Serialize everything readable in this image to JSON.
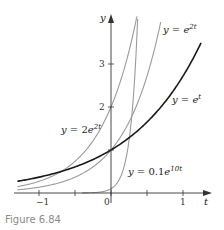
{
  "caption": "Figure 6.84",
  "colors": {
    "axis": "#333333",
    "primary_curve": "#1a1a1a",
    "secondary_curve": "#9a9a9a",
    "caption": "#8a8a8a"
  },
  "chart_data": {
    "type": "line",
    "title": "",
    "xlabel": "t",
    "ylabel": "y",
    "xlim": [
      -1.3,
      1.35
    ],
    "ylim": [
      0,
      4.1
    ],
    "grid": false,
    "x_ticks": [
      -1,
      -0.5,
      0,
      0.5,
      1
    ],
    "x_tick_labels": [
      "-1",
      "",
      "0",
      "",
      "1"
    ],
    "y_ticks": [
      1,
      2,
      3
    ],
    "y_tick_labels": [
      "",
      "2",
      "3"
    ],
    "series": [
      {
        "name": "y = e^t",
        "formula": "e^t",
        "k": 1,
        "a": 1,
        "t_range": [
          -1.3,
          1.25
        ],
        "style": "bold-black",
        "label": {
          "text": "y = e",
          "sup": "t",
          "x": 172,
          "y": 103
        }
      },
      {
        "name": "y = e^{2t}",
        "formula": "e^(2t)",
        "k": 2,
        "a": 1,
        "t_range": [
          -1.3,
          0.69
        ],
        "style": "gray",
        "label": {
          "text": "y = e",
          "sup": "2t",
          "x": 163,
          "y": 33
        }
      },
      {
        "name": "y = 2e^{2t}",
        "formula": "2e^(2t)",
        "k": 2,
        "a": 2,
        "t_range": [
          -1.3,
          0.36
        ],
        "style": "gray",
        "label": {
          "text": "y = 2e",
          "sup": "2t",
          "x": 61,
          "y": 133
        }
      },
      {
        "name": "y = 0.1e^{10t}",
        "formula": "0.1e^(10t)",
        "k": 10,
        "a": 0.1,
        "t_range": [
          -0.4,
          0.37
        ],
        "style": "gray",
        "label": {
          "text": "y = 0.1e",
          "sup": "10t",
          "x": 128,
          "y": 175
        }
      }
    ],
    "annotations": [
      "y = e^{2t}",
      "y = e^t",
      "y = 2e^{2t}",
      "y = 0.1e^{10t}"
    ]
  }
}
